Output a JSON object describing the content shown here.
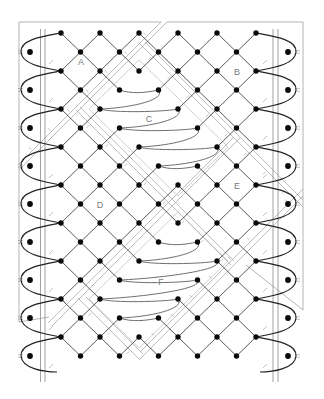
{
  "regions": [
    {
      "label": "A"
    },
    {
      "label": "B"
    },
    {
      "label": "C"
    },
    {
      "label": "D"
    },
    {
      "label": "E"
    },
    {
      "label": "F"
    }
  ],
  "diagram": {
    "grid": {
      "rows": 18,
      "even_row_pins": 6,
      "odd_row_pins": 5
    },
    "footside": {
      "sides": [
        "left",
        "right"
      ],
      "pins_per_side": 9
    },
    "cloth_areas": [
      {
        "label": "C",
        "u_range": [
          6,
          14
        ],
        "v_range": [
          -2,
          2
        ],
        "worker_path": [
          [
            3,
            3
          ],
          [
            3,
            5
          ],
          [
            4,
            2
          ],
          [
            4,
            6
          ],
          [
            5,
            3
          ],
          [
            5,
            7
          ],
          [
            6,
            4
          ],
          [
            6,
            8
          ],
          [
            7,
            5
          ],
          [
            7,
            7
          ]
        ]
      },
      {
        "label": "F",
        "u_range": [
          16,
          20
        ],
        "v_range": [
          -12,
          -4
        ],
        "worker_path": [
          [
            11,
            5
          ],
          [
            11,
            7
          ],
          [
            12,
            4
          ],
          [
            12,
            8
          ],
          [
            13,
            3
          ],
          [
            13,
            7
          ],
          [
            14,
            2
          ],
          [
            14,
            6
          ],
          [
            15,
            3
          ],
          [
            15,
            5
          ]
        ]
      }
    ]
  },
  "colors": {
    "pin": "#0a0a0a",
    "grid_line": "#2e2e2e",
    "footside_thread": "#222222",
    "worker_thread": "#5e5e5e",
    "guide_line": "#a2a2a2",
    "label": "#7a7a7a",
    "background": "#ffffff"
  }
}
